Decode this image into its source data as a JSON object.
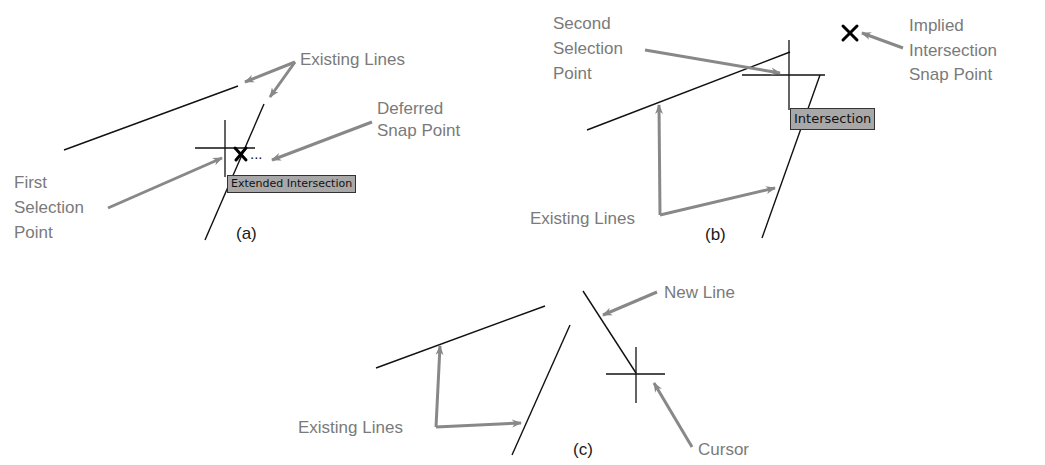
{
  "panels": {
    "a": {
      "caption": "(a)",
      "labels": {
        "existing_lines": "Existing Lines",
        "deferred_snap_1": "Deferred",
        "deferred_snap_2": "Snap Point",
        "first_sel_1": "First",
        "first_sel_2": "Selection",
        "first_sel_3": "Point"
      },
      "tooltip": "Extended Intersection",
      "ellipsis": "..."
    },
    "b": {
      "caption": "(b)",
      "labels": {
        "second_sel_1": "Second",
        "second_sel_2": "Selection",
        "second_sel_3": "Point",
        "implied_1": "Implied",
        "implied_2": "Intersection",
        "implied_3": "Snap Point",
        "existing_lines": "Existing Lines"
      },
      "tooltip": "Intersection"
    },
    "c": {
      "caption": "(c)",
      "labels": {
        "new_line": "New Line",
        "existing_lines": "Existing Lines",
        "cursor": "Cursor"
      }
    }
  },
  "colors": {
    "label": "#7a7a7a",
    "arrow": "#888888",
    "line": "#111111",
    "tooltip_bg": "#a8a8a8"
  }
}
